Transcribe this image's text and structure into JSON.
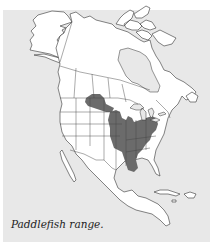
{
  "map": {
    "subject": "Paddlefish",
    "region": "North America",
    "caption": "Paddlefish range.",
    "colors": {
      "background": "#e8e8e8",
      "land": "#ffffff",
      "outline": "#333333",
      "range": "#6b6b6b"
    },
    "shaded_regions": [
      "Mississippi River basin (central United States)",
      "Missouri River (Montana / North Dakota)",
      "Ohio River basin",
      "Lower Mississippi to Gulf Coast (Louisiana)"
    ]
  }
}
